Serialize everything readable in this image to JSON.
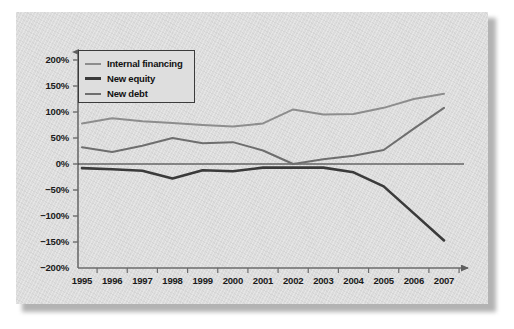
{
  "chart_data": {
    "type": "line",
    "title": "",
    "subtitle": "",
    "xlabel": "",
    "ylabel": "",
    "categories": [
      "1995",
      "1996",
      "1997",
      "1998",
      "1999",
      "2000",
      "2001",
      "2002",
      "2003",
      "2004",
      "2005",
      "2006",
      "2007"
    ],
    "x": [
      1995,
      1996,
      1997,
      1998,
      1999,
      2000,
      2001,
      2002,
      2003,
      2004,
      2005,
      2006,
      2007
    ],
    "ylim": [
      -200,
      200
    ],
    "ytick_values": [
      200,
      150,
      100,
      50,
      0,
      -50,
      -100,
      -150,
      -200
    ],
    "ytick_labels": [
      "200%",
      "150%",
      "100%",
      "50%",
      "0%",
      "−50%",
      "−100%",
      "−150%",
      "−200%"
    ],
    "grid": false,
    "legend_position": "upper-left",
    "zero_line": true,
    "series": [
      {
        "name": "Internal financing",
        "color": "#8d8d8d",
        "width": 2.0,
        "values": [
          78,
          88,
          82,
          79,
          75,
          72,
          78,
          105,
          95,
          96,
          108,
          125,
          135
        ]
      },
      {
        "name": "New equity",
        "color": "#3a3a3a",
        "width": 2.6,
        "values": [
          -8,
          -10,
          -13,
          -28,
          -12,
          -14,
          -7,
          -7,
          -7,
          -16,
          -43,
          -95,
          -147
        ]
      },
      {
        "name": "New debt",
        "color": "#6e6e6e",
        "width": 2.0,
        "values": [
          32,
          23,
          35,
          50,
          40,
          42,
          26,
          0,
          9,
          16,
          27,
          68,
          108
        ]
      }
    ]
  },
  "axes": {
    "y_axis_name": "percent-axis",
    "x_axis_name": "year-axis",
    "arrow_top": true,
    "arrow_right": true
  },
  "colors": {
    "panel_background": "#dcdcdc",
    "axis": "#6b6b6b",
    "text": "#1a1a1a",
    "legend_border": "#3b3b3b",
    "internal_financing": "#8d8d8d",
    "new_equity": "#3a3a3a",
    "new_debt": "#6e6e6e"
  }
}
